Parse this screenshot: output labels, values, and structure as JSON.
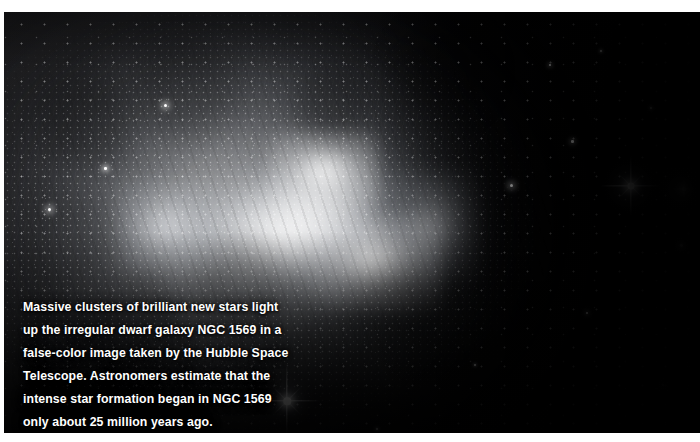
{
  "page": {
    "background_color": "#ffffff",
    "width": 700,
    "height": 442
  },
  "figure": {
    "alt_subject": "NGC 1569 irregular dwarf galaxy",
    "frame": {
      "left": 4,
      "top": 12,
      "width": 696,
      "height": 421,
      "background_color": "#000005"
    },
    "caption": {
      "text": "Massive clusters of brilliant new stars light\nup the irregular dwarf galaxy NGC 1569 in a\nfalse-color image taken by the Hubble Space\nTelescope. Astronomers estimate that the\nintense star formation began in NGC 1569\nonly about 25 million years ago.",
      "lines": [
        "Massive clusters of brilliant new stars light",
        "up the irregular dwarf galaxy NGC 1569 in a",
        "false-color image taken by the Hubble Space",
        "Telescope. Astronomers estimate that the",
        "intense star formation began in NGC 1569",
        "only about 25 million years ago."
      ],
      "text_color": "#ffffff"
    },
    "bright_stars": [
      {
        "name": "diffraction-star-right",
        "x": 631,
        "y": 186,
        "size": 7,
        "spike": 30
      },
      {
        "name": "diffraction-star-bottom-left",
        "x": 287,
        "y": 401,
        "size": 7.5,
        "spike": 34
      },
      {
        "name": "diffraction-star-far-right",
        "x": 684,
        "y": 189,
        "size": 4,
        "spike": 12
      }
    ]
  }
}
